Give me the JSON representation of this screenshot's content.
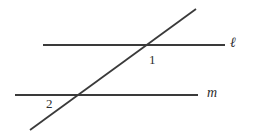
{
  "figure": {
    "background_color": "#ffffff",
    "stroke_color": "#3a3a3a",
    "text_color": "#2e2e2e",
    "stroke_width": 1.8,
    "width": 254,
    "height": 134
  },
  "labels": {
    "line_l": "ℓ",
    "line_m": "m",
    "angle_1": "1",
    "angle_2": "2"
  },
  "chart_data": {
    "type": "diagram",
    "subtype": "euclidean-geometry-transversal",
    "xlim": [
      0,
      254
    ],
    "ylim": [
      134,
      0
    ],
    "grid": false,
    "legend": null,
    "lines": [
      {
        "name": "line-l",
        "label": "ℓ",
        "role": "parallel-line-upper",
        "x1": 43,
        "y1": 45,
        "x2": 225,
        "y2": 45,
        "label_x": 233,
        "label_y": 43,
        "color": "#3a3a3a",
        "width": 1.8
      },
      {
        "name": "line-m",
        "label": "m",
        "role": "parallel-line-lower",
        "x1": 15,
        "y1": 95,
        "x2": 198,
        "y2": 95,
        "label_x": 210,
        "label_y": 93,
        "color": "#3a3a3a",
        "width": 1.8
      },
      {
        "name": "transversal",
        "label": "",
        "role": "transversal",
        "x1": 30,
        "y1": 130,
        "x2": 196,
        "y2": 9,
        "label_x": null,
        "label_y": null,
        "color": "#3a3a3a",
        "width": 1.8
      }
    ],
    "intersections": [
      {
        "name": "upper-intersection",
        "lines": [
          "line-l",
          "transversal"
        ],
        "x": 144,
        "y": 45,
        "angle_label": "1",
        "angle_label_x": 152,
        "angle_label_y": 60,
        "angle_label_position": "below-right"
      },
      {
        "name": "lower-intersection",
        "lines": [
          "line-m",
          "transversal"
        ],
        "x": 74,
        "y": 95,
        "angle_label": "2",
        "angle_label_x": 50,
        "angle_label_y": 105,
        "angle_label_position": "below-left"
      }
    ],
    "annotations": [
      {
        "text": "ℓ",
        "x": 233,
        "y": 43,
        "style": "italic"
      },
      {
        "text": "m",
        "x": 210,
        "y": 93,
        "style": "italic"
      },
      {
        "text": "1",
        "x": 152,
        "y": 60,
        "style": "normal"
      },
      {
        "text": "2",
        "x": 50,
        "y": 105,
        "style": "normal"
      }
    ]
  }
}
